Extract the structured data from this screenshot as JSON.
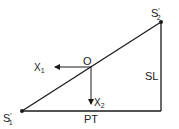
{
  "diagram": {
    "type": "right-triangle-geometry",
    "colors": {
      "stroke": "#1a1a1a",
      "text": "#222222",
      "background": "#ffffff"
    },
    "points": {
      "s1": {
        "label": "S",
        "prime": "′",
        "sub": "1",
        "x": 22,
        "y": 111
      },
      "s2": {
        "label": "S",
        "prime": "′",
        "sub": "2",
        "x": 161,
        "y": 22
      },
      "o": {
        "label": "O",
        "x": 88,
        "y": 61
      }
    },
    "edges": {
      "hypotenuse": {
        "from": "s1",
        "to": "s2"
      },
      "base": {
        "label": "PT"
      },
      "vertical": {
        "label": "SL"
      }
    },
    "vectors": {
      "x1": {
        "label": "X",
        "sub": "1",
        "direction": "left"
      },
      "x2": {
        "label": "X",
        "sub": "2",
        "direction": "down"
      }
    }
  }
}
